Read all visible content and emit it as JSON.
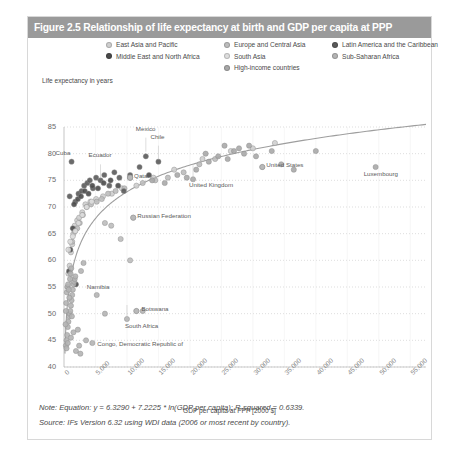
{
  "figure": {
    "title": "Figure 2.5 Relationship of life expectancy at birth and GDP per capita at PPP",
    "title_bar_color": "#9a9a9a",
    "border_color": "#d8d8d8"
  },
  "notes": {
    "note": "Note: Equation: y = 6.3290 + 7.2225 * ln(GDP per capita); R-squared = 0.6339.",
    "source": "Source: IFs Version 6.32 using WDI data (2006 or most recent by country)."
  },
  "chart_data": {
    "type": "scatter",
    "title": "Figure 2.5 Relationship of life expectancy at birth and GDP per capita at PPP",
    "xlabel": "GDP per capita at PPP [2000 $]",
    "ylabel": "Life expectancy in years",
    "xlim": [
      0,
      57500
    ],
    "ylim": [
      40,
      85
    ],
    "xticks": [
      0,
      5000,
      10000,
      15000,
      20000,
      25000,
      30000,
      35000,
      40000,
      45000,
      50000,
      55000
    ],
    "xtick_labels": [
      "0",
      "5,000",
      "10,000",
      "15,000",
      "20,000",
      "25,000",
      "30,000",
      "35,000",
      "40,000",
      "45,000",
      "50,000",
      "55,000"
    ],
    "yticks": [
      40,
      45,
      50,
      55,
      60,
      65,
      70,
      75,
      80,
      85
    ],
    "ytick_labels": [
      "40",
      "45",
      "50",
      "55",
      "60",
      "65",
      "70",
      "75",
      "80",
      "85"
    ],
    "grid": "horizontal-dotted",
    "legend_position": "top",
    "trendline": {
      "equation": "y = 6.3290 + 7.2225 * ln(GDP per capita)",
      "r_squared": 0.6339,
      "intercept": 6.329,
      "slope": 7.2225,
      "color": "#9e9e9e"
    },
    "series": [
      {
        "name": "East Asia and Pacific",
        "color": "#cfcfcf",
        "marker": "circle"
      },
      {
        "name": "Europe and Central Asia",
        "color": "#bdbdbd",
        "marker": "circle"
      },
      {
        "name": "Latin America and the Caribbean",
        "color": "#5a5a5a",
        "marker": "circle"
      },
      {
        "name": "Middle East and North Africa",
        "color": "#4a4a4a",
        "marker": "circle"
      },
      {
        "name": "South Asia",
        "color": "#dedede",
        "marker": "circle"
      },
      {
        "name": "Sub-Saharan Africa",
        "color": "#b4b4b4",
        "marker": "circle"
      },
      {
        "name": "High-income countries",
        "color": "#a8a8a8",
        "marker": "circle"
      }
    ],
    "annotations": [
      {
        "label": "Cuba",
        "x": 1200,
        "y": 78.5
      },
      {
        "label": "Ecuador",
        "x": 5800,
        "y": 78.0
      },
      {
        "label": "Mexico",
        "x": 13000,
        "y": 83.0
      },
      {
        "label": "Chile",
        "x": 15000,
        "y": 81.5
      },
      {
        "label": "Qatar",
        "x": 10500,
        "y": 75.5
      },
      {
        "label": "United Kingdom",
        "x": 20500,
        "y": 75.2
      },
      {
        "label": "United States",
        "x": 31500,
        "y": 77.5
      },
      {
        "label": "Luxembourg",
        "x": 49500,
        "y": 77.5
      },
      {
        "label": "Russian Federation",
        "x": 11000,
        "y": 68.0
      },
      {
        "label": "Namibia",
        "x": 5200,
        "y": 53.5
      },
      {
        "label": "Botswana",
        "x": 11500,
        "y": 50.5
      },
      {
        "label": "South Africa",
        "x": 10000,
        "y": 49.0
      },
      {
        "label": "Congo, Democratic Republic of",
        "x": 4500,
        "y": 44.5
      }
    ],
    "points": [
      {
        "s": 0,
        "x": 600,
        "y": 55.0
      },
      {
        "s": 0,
        "x": 700,
        "y": 57.5
      },
      {
        "s": 0,
        "x": 900,
        "y": 59.0
      },
      {
        "s": 0,
        "x": 1100,
        "y": 61.5
      },
      {
        "s": 0,
        "x": 1300,
        "y": 63.0
      },
      {
        "s": 0,
        "x": 1500,
        "y": 65.0
      },
      {
        "s": 0,
        "x": 1700,
        "y": 66.5
      },
      {
        "s": 0,
        "x": 2100,
        "y": 67.5
      },
      {
        "s": 0,
        "x": 2400,
        "y": 68.0
      },
      {
        "s": 0,
        "x": 2900,
        "y": 69.0
      },
      {
        "s": 0,
        "x": 3400,
        "y": 70.5
      },
      {
        "s": 0,
        "x": 4200,
        "y": 71.0
      },
      {
        "s": 0,
        "x": 5100,
        "y": 71.5
      },
      {
        "s": 0,
        "x": 6200,
        "y": 72.0
      },
      {
        "s": 0,
        "x": 7600,
        "y": 72.5
      },
      {
        "s": 0,
        "x": 9200,
        "y": 73.5
      },
      {
        "s": 0,
        "x": 11500,
        "y": 74.0
      },
      {
        "s": 0,
        "x": 14200,
        "y": 75.5
      },
      {
        "s": 0,
        "x": 17500,
        "y": 77.0
      },
      {
        "s": 0,
        "x": 22000,
        "y": 79.0
      },
      {
        "s": 0,
        "x": 26500,
        "y": 80.5
      },
      {
        "s": 0,
        "x": 30000,
        "y": 81.0
      },
      {
        "s": 0,
        "x": 33500,
        "y": 82.0
      },
      {
        "s": 1,
        "x": 1300,
        "y": 63.5
      },
      {
        "s": 1,
        "x": 1700,
        "y": 65.5
      },
      {
        "s": 1,
        "x": 2100,
        "y": 66.0
      },
      {
        "s": 1,
        "x": 2500,
        "y": 67.0
      },
      {
        "s": 1,
        "x": 3000,
        "y": 68.5
      },
      {
        "s": 1,
        "x": 3600,
        "y": 70.0
      },
      {
        "s": 1,
        "x": 4300,
        "y": 70.5
      },
      {
        "s": 1,
        "x": 5200,
        "y": 71.0
      },
      {
        "s": 1,
        "x": 6000,
        "y": 71.5
      },
      {
        "s": 1,
        "x": 7000,
        "y": 72.5
      },
      {
        "s": 1,
        "x": 8200,
        "y": 73.0
      },
      {
        "s": 1,
        "x": 9600,
        "y": 73.5
      },
      {
        "s": 1,
        "x": 11000,
        "y": 68.0
      },
      {
        "s": 1,
        "x": 12500,
        "y": 74.5
      },
      {
        "s": 1,
        "x": 14500,
        "y": 75.0
      },
      {
        "s": 1,
        "x": 16500,
        "y": 75.5
      },
      {
        "s": 1,
        "x": 19000,
        "y": 76.5
      },
      {
        "s": 1,
        "x": 21500,
        "y": 78.0
      },
      {
        "s": 1,
        "x": 24000,
        "y": 79.0
      },
      {
        "s": 1,
        "x": 9000,
        "y": 64.0
      },
      {
        "s": 1,
        "x": 7500,
        "y": 66.5
      },
      {
        "s": 1,
        "x": 6500,
        "y": 67.0
      },
      {
        "s": 1,
        "x": 10500,
        "y": 60.0
      },
      {
        "s": 2,
        "x": 900,
        "y": 72.0
      },
      {
        "s": 2,
        "x": 1200,
        "y": 78.5
      },
      {
        "s": 2,
        "x": 1800,
        "y": 71.0
      },
      {
        "s": 2,
        "x": 2300,
        "y": 72.5
      },
      {
        "s": 2,
        "x": 2800,
        "y": 73.0
      },
      {
        "s": 2,
        "x": 3200,
        "y": 74.0
      },
      {
        "s": 2,
        "x": 3700,
        "y": 74.5
      },
      {
        "s": 2,
        "x": 4100,
        "y": 75.0
      },
      {
        "s": 2,
        "x": 4600,
        "y": 73.5
      },
      {
        "s": 2,
        "x": 5100,
        "y": 75.5
      },
      {
        "s": 2,
        "x": 5800,
        "y": 75.0
      },
      {
        "s": 2,
        "x": 6400,
        "y": 76.0
      },
      {
        "s": 2,
        "x": 7200,
        "y": 74.0
      },
      {
        "s": 2,
        "x": 8000,
        "y": 76.5
      },
      {
        "s": 2,
        "x": 8800,
        "y": 75.5
      },
      {
        "s": 2,
        "x": 9500,
        "y": 73.0
      },
      {
        "s": 2,
        "x": 10500,
        "y": 76.0
      },
      {
        "s": 2,
        "x": 12000,
        "y": 77.5
      },
      {
        "s": 2,
        "x": 13000,
        "y": 79.5
      },
      {
        "s": 2,
        "x": 15000,
        "y": 78.5
      },
      {
        "s": 3,
        "x": 1600,
        "y": 70.5
      },
      {
        "s": 3,
        "x": 2200,
        "y": 71.5
      },
      {
        "s": 3,
        "x": 2700,
        "y": 72.0
      },
      {
        "s": 3,
        "x": 3300,
        "y": 73.0
      },
      {
        "s": 3,
        "x": 3900,
        "y": 72.5
      },
      {
        "s": 3,
        "x": 4500,
        "y": 74.0
      },
      {
        "s": 3,
        "x": 5400,
        "y": 73.5
      },
      {
        "s": 3,
        "x": 6300,
        "y": 74.5
      },
      {
        "s": 3,
        "x": 7400,
        "y": 75.0
      },
      {
        "s": 3,
        "x": 8600,
        "y": 74.0
      },
      {
        "s": 3,
        "x": 10500,
        "y": 75.5
      },
      {
        "s": 3,
        "x": 13500,
        "y": 76.0
      },
      {
        "s": 3,
        "x": 1000,
        "y": 62.0
      },
      {
        "s": 3,
        "x": 1400,
        "y": 66.0
      },
      {
        "s": 3,
        "x": 800,
        "y": 58.0
      },
      {
        "s": 3,
        "x": 1900,
        "y": 55.5
      },
      {
        "s": 4,
        "x": 700,
        "y": 62.0
      },
      {
        "s": 4,
        "x": 1000,
        "y": 63.5
      },
      {
        "s": 4,
        "x": 1400,
        "y": 64.5
      },
      {
        "s": 4,
        "x": 1800,
        "y": 65.5
      },
      {
        "s": 4,
        "x": 2300,
        "y": 67.0
      },
      {
        "s": 4,
        "x": 2900,
        "y": 68.5
      },
      {
        "s": 4,
        "x": 3600,
        "y": 70.0
      },
      {
        "s": 4,
        "x": 4400,
        "y": 71.0
      },
      {
        "s": 5,
        "x": 300,
        "y": 44.0
      },
      {
        "s": 5,
        "x": 400,
        "y": 45.0
      },
      {
        "s": 5,
        "x": 500,
        "y": 46.0
      },
      {
        "s": 5,
        "x": 600,
        "y": 47.5
      },
      {
        "s": 5,
        "x": 700,
        "y": 48.5
      },
      {
        "s": 5,
        "x": 800,
        "y": 49.5
      },
      {
        "s": 5,
        "x": 900,
        "y": 50.0
      },
      {
        "s": 5,
        "x": 1000,
        "y": 50.5
      },
      {
        "s": 5,
        "x": 1100,
        "y": 51.5
      },
      {
        "s": 5,
        "x": 1200,
        "y": 52.5
      },
      {
        "s": 5,
        "x": 1300,
        "y": 53.5
      },
      {
        "s": 5,
        "x": 1400,
        "y": 54.5
      },
      {
        "s": 5,
        "x": 1500,
        "y": 55.5
      },
      {
        "s": 5,
        "x": 1600,
        "y": 56.0
      },
      {
        "s": 5,
        "x": 1700,
        "y": 56.5
      },
      {
        "s": 5,
        "x": 1800,
        "y": 57.0
      },
      {
        "s": 5,
        "x": 400,
        "y": 43.5
      },
      {
        "s": 5,
        "x": 600,
        "y": 44.5
      },
      {
        "s": 5,
        "x": 1100,
        "y": 45.5
      },
      {
        "s": 5,
        "x": 1500,
        "y": 46.5
      },
      {
        "s": 5,
        "x": 2200,
        "y": 47.0
      },
      {
        "s": 5,
        "x": 2700,
        "y": 58.0
      },
      {
        "s": 5,
        "x": 3100,
        "y": 59.5
      },
      {
        "s": 5,
        "x": 4500,
        "y": 44.5
      },
      {
        "s": 5,
        "x": 5200,
        "y": 53.5
      },
      {
        "s": 5,
        "x": 6500,
        "y": 50.0
      },
      {
        "s": 5,
        "x": 10000,
        "y": 49.0
      },
      {
        "s": 5,
        "x": 11500,
        "y": 50.5
      },
      {
        "s": 5,
        "x": 12500,
        "y": 50.5
      },
      {
        "s": 5,
        "x": 3500,
        "y": 45.0
      },
      {
        "s": 5,
        "x": 2400,
        "y": 44.0
      },
      {
        "s": 5,
        "x": 1900,
        "y": 43.0
      },
      {
        "s": 5,
        "x": 2600,
        "y": 42.5
      },
      {
        "s": 5,
        "x": 350,
        "y": 52.0
      },
      {
        "s": 5,
        "x": 450,
        "y": 54.0
      },
      {
        "s": 5,
        "x": 550,
        "y": 55.0
      },
      {
        "s": 5,
        "x": 650,
        "y": 55.5
      },
      {
        "s": 5,
        "x": 750,
        "y": 54.5
      },
      {
        "s": 5,
        "x": 850,
        "y": 53.0
      },
      {
        "s": 5,
        "x": 950,
        "y": 56.5
      },
      {
        "s": 5,
        "x": 1050,
        "y": 57.5
      },
      {
        "s": 5,
        "x": 1150,
        "y": 58.5
      },
      {
        "s": 5,
        "x": 250,
        "y": 48.0
      },
      {
        "s": 5,
        "x": 300,
        "y": 50.5
      },
      {
        "s": 5,
        "x": 1250,
        "y": 49.5
      },
      {
        "s": 6,
        "x": 21000,
        "y": 77.0
      },
      {
        "s": 6,
        "x": 23000,
        "y": 78.5
      },
      {
        "s": 6,
        "x": 24500,
        "y": 79.5
      },
      {
        "s": 6,
        "x": 26000,
        "y": 79.0
      },
      {
        "s": 6,
        "x": 27000,
        "y": 80.5
      },
      {
        "s": 6,
        "x": 27800,
        "y": 81.0
      },
      {
        "s": 6,
        "x": 28600,
        "y": 80.0
      },
      {
        "s": 6,
        "x": 29400,
        "y": 81.5
      },
      {
        "s": 6,
        "x": 30500,
        "y": 79.5
      },
      {
        "s": 6,
        "x": 31500,
        "y": 77.5
      },
      {
        "s": 6,
        "x": 33000,
        "y": 80.5
      },
      {
        "s": 6,
        "x": 34500,
        "y": 78.0
      },
      {
        "s": 6,
        "x": 36500,
        "y": 77.0
      },
      {
        "s": 6,
        "x": 40000,
        "y": 80.5
      },
      {
        "s": 6,
        "x": 49500,
        "y": 77.5
      },
      {
        "s": 6,
        "x": 19500,
        "y": 75.5
      },
      {
        "s": 6,
        "x": 18000,
        "y": 76.0
      },
      {
        "s": 6,
        "x": 20500,
        "y": 75.2
      },
      {
        "s": 6,
        "x": 16000,
        "y": 74.5
      },
      {
        "s": 6,
        "x": 14000,
        "y": 75.0
      },
      {
        "s": 6,
        "x": 25500,
        "y": 81.5
      },
      {
        "s": 6,
        "x": 22500,
        "y": 80.0
      },
      {
        "s": 6,
        "x": 10500,
        "y": 75.5
      }
    ]
  },
  "legend": {
    "items": [
      {
        "label": "East Asia and Pacific",
        "color": "#cfcfcf"
      },
      {
        "label": "Europe and Central Asia",
        "color": "#bdbdbd"
      },
      {
        "label": "Latin America and the Caribbean",
        "color": "#5a5a5a"
      },
      {
        "label": "Middle East and North Africa",
        "color": "#4a4a4a"
      },
      {
        "label": "South Asia",
        "color": "#dedede"
      },
      {
        "label": "Sub-Saharan Africa",
        "color": "#b4b4b4"
      },
      {
        "label": "High-income countries",
        "color": "#a8a8a8"
      }
    ]
  }
}
